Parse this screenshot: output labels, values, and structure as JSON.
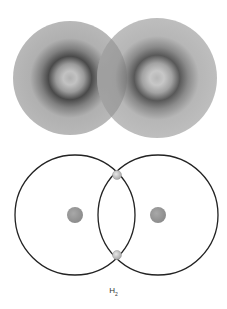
{
  "diagram": {
    "top_panel": {
      "description": "Electron density clouds of two hydrogen atoms overlapping",
      "atoms": [
        {
          "cx": 70,
          "cy": 78,
          "r": 57
        },
        {
          "cx": 157,
          "cy": 78,
          "r": 60
        }
      ],
      "colors": {
        "outer": "#b4b4b4",
        "ring": "#4a4a4a",
        "center": "#a8a8a8",
        "overlap": "#8e8e8e"
      }
    },
    "bottom_panel": {
      "description": "Shell model with shared electron pair",
      "shells": [
        {
          "cx": 75,
          "cy": 215,
          "r": 60
        },
        {
          "cx": 158,
          "cy": 215,
          "r": 60
        }
      ],
      "nuclei": [
        {
          "cx": 75,
          "cy": 215,
          "r": 8
        },
        {
          "cx": 158,
          "cy": 215,
          "r": 8
        }
      ],
      "electrons": [
        {
          "cx": 117,
          "cy": 175,
          "r": 4.5
        },
        {
          "cx": 117,
          "cy": 255,
          "r": 4.5
        }
      ],
      "colors": {
        "shell": "#222222",
        "nucleus": "#999999",
        "electron": "#c8c8c8"
      }
    },
    "label": {
      "main": "H",
      "subscript": "2"
    }
  }
}
